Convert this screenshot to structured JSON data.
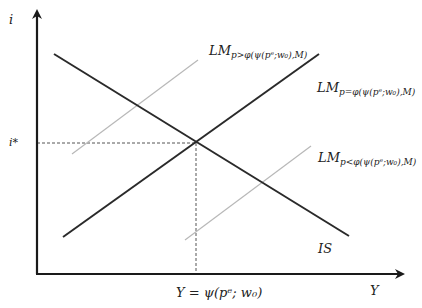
{
  "colors": {
    "axis": "#1a1a1a",
    "main_line": "#2a2a2a",
    "shifted_line": "#b8b8b8",
    "guide": "#555555",
    "background": "#ffffff"
  },
  "axes": {
    "y_label": "i",
    "x_label": "Y"
  },
  "equilibrium": {
    "i_label": "i*",
    "y_label": "Y = ψ(pᵉ; w₀)"
  },
  "curves": {
    "is": {
      "label": "IS"
    },
    "lm_main": {
      "label_main": "LM",
      "label_sub": "p=φ(ψ(pᵉ;w₀),M)"
    },
    "lm_upper": {
      "label_main": "LM",
      "label_sub": "p>φ(ψ(pᵉ;w₀),M)"
    },
    "lm_lower": {
      "label_main": "LM",
      "label_sub": "p<φ(ψ(pᵉ;w₀),M)"
    }
  }
}
